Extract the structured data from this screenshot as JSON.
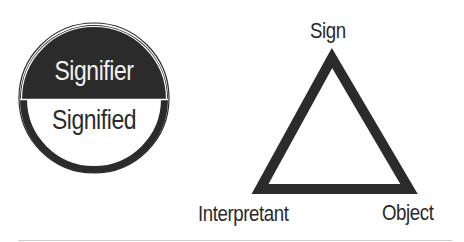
{
  "saussure_model": {
    "top_label": "Signifier",
    "bottom_label": "Signified"
  },
  "peirce_model": {
    "apex_label": "Sign",
    "bottom_left_label": "Interpretant",
    "bottom_right_label": "Object"
  },
  "colors": {
    "ink": "#2b2b2b",
    "background": "#ffffff",
    "rule": "#cfcfcf"
  }
}
